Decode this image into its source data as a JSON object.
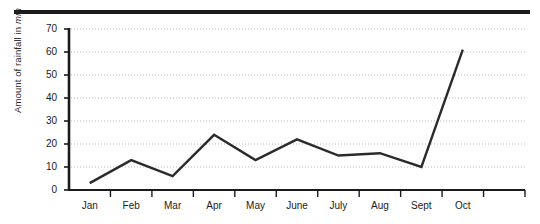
{
  "figure": {
    "top_rule": "decorative-rule"
  },
  "chart_data": {
    "type": "line",
    "title": "",
    "xlabel": "",
    "ylabel": "Amount of rainfall in mm",
    "ylabel_plain": "Amount of rainfall in ",
    "ylabel_italic": "mm",
    "categories": [
      "Jan",
      "Feb",
      "Mar",
      "Apr",
      "May",
      "June",
      "July",
      "Aug",
      "Sept",
      "Oct"
    ],
    "values": [
      3,
      13,
      6,
      24,
      13,
      22,
      15,
      16,
      10,
      61
    ],
    "ylim": [
      0,
      70
    ],
    "ytick_values": [
      0,
      10,
      20,
      30,
      40,
      50,
      60,
      70
    ],
    "ytick_labels": [
      "0",
      "10",
      "20",
      "30",
      "40",
      "50",
      "60",
      "70"
    ],
    "grid": true,
    "grid_style": "dotted-horizontal",
    "legend": null,
    "series_color": "#2b2b2b",
    "axis_color": "#1b1b1b",
    "grid_color": "#b9b9bd"
  }
}
